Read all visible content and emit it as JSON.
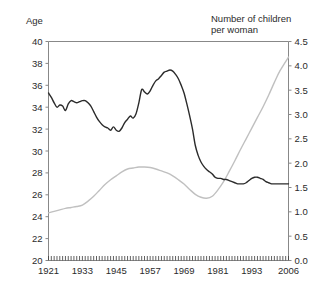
{
  "chart_data": {
    "type": "line",
    "title": "",
    "xlabel": "",
    "left_axis": {
      "label": "Age",
      "ticks": [
        "20",
        "22",
        "24",
        "26",
        "28",
        "30",
        "32",
        "34",
        "36",
        "38",
        "40"
      ],
      "min": 20,
      "max": 40
    },
    "right_axis": {
      "label": "Number of children\nper woman",
      "ticks": [
        "0.0",
        "0.5",
        "1.0",
        "1.5",
        "2.0",
        "2.5",
        "3.0",
        "3.5",
        "4.0",
        "4.5"
      ],
      "min": 0.0,
      "max": 4.5
    },
    "x_ticks": [
      "1921",
      "1933",
      "1945",
      "1957",
      "1969",
      "1981",
      "1993",
      "2006"
    ],
    "xlim": [
      1921,
      2006
    ],
    "grid": false,
    "legend_position": "none",
    "colors": {
      "age_line": "#2b2b2b",
      "children_line": "#c0c0c0",
      "axis": "#888888"
    },
    "series": [
      {
        "name": "Number of children per woman",
        "axis": "right",
        "color": "#c0c0c0",
        "x": [
          1921,
          1923,
          1925,
          1927,
          1929,
          1931,
          1933,
          1935,
          1937,
          1939,
          1941,
          1943,
          1945,
          1947,
          1949,
          1951,
          1953,
          1955,
          1957,
          1959,
          1961,
          1963,
          1965,
          1967,
          1969,
          1971,
          1973,
          1975,
          1977,
          1979,
          1981,
          1983,
          1985,
          1987,
          1989,
          1991,
          1993,
          1995,
          1997,
          1999,
          2001,
          2003,
          2006
        ],
        "values": [
          0.98,
          1.01,
          1.04,
          1.07,
          1.09,
          1.11,
          1.14,
          1.22,
          1.32,
          1.44,
          1.56,
          1.66,
          1.74,
          1.82,
          1.88,
          1.9,
          1.92,
          1.92,
          1.91,
          1.88,
          1.84,
          1.8,
          1.74,
          1.66,
          1.57,
          1.46,
          1.36,
          1.3,
          1.28,
          1.32,
          1.45,
          1.62,
          1.83,
          2.05,
          2.28,
          2.5,
          2.72,
          2.94,
          3.16,
          3.4,
          3.66,
          3.9,
          4.18
        ]
      },
      {
        "name": "Age",
        "axis": "left",
        "color": "#2b2b2b",
        "x": [
          1921,
          1922,
          1923,
          1924,
          1925,
          1926,
          1927,
          1928,
          1929,
          1930,
          1931,
          1932,
          1933,
          1934,
          1935,
          1936,
          1937,
          1938,
          1939,
          1940,
          1941,
          1942,
          1943,
          1944,
          1945,
          1946,
          1947,
          1948,
          1949,
          1950,
          1951,
          1952,
          1953,
          1954,
          1955,
          1956,
          1957,
          1958,
          1959,
          1960,
          1961,
          1962,
          1963,
          1964,
          1965,
          1966,
          1967,
          1968,
          1969,
          1970,
          1971,
          1972,
          1973,
          1974,
          1975,
          1976,
          1977,
          1978,
          1979,
          1980,
          1981,
          1982,
          1983,
          1984,
          1985,
          1986,
          1987,
          1988,
          1989,
          1990,
          1991,
          1992,
          1993,
          1994,
          1995,
          1996,
          1997,
          1998,
          1999,
          2000,
          2001,
          2002,
          2003,
          2004,
          2005,
          2006
        ],
        "values": [
          35.3,
          34.9,
          34.4,
          34.0,
          34.2,
          34.1,
          33.7,
          34.3,
          34.6,
          34.5,
          34.4,
          34.5,
          34.6,
          34.6,
          34.4,
          34.1,
          33.6,
          33.1,
          32.7,
          32.4,
          32.2,
          32.1,
          31.9,
          32.2,
          31.9,
          31.8,
          32.1,
          32.6,
          32.9,
          33.2,
          33.0,
          33.4,
          34.4,
          35.6,
          35.4,
          35.2,
          35.5,
          36.0,
          36.4,
          36.6,
          36.9,
          37.2,
          37.3,
          37.4,
          37.3,
          37.0,
          36.6,
          36.0,
          35.3,
          34.3,
          33.2,
          32.0,
          30.5,
          29.6,
          29.0,
          28.6,
          28.3,
          28.1,
          27.9,
          27.6,
          27.5,
          27.5,
          27.4,
          27.4,
          27.3,
          27.2,
          27.1,
          27.0,
          27.0,
          27.0,
          27.1,
          27.3,
          27.5,
          27.6,
          27.6,
          27.5,
          27.4,
          27.2,
          27.1,
          27.0,
          27.0,
          27.0,
          27.0,
          27.0,
          27.0,
          27.0
        ]
      }
    ]
  }
}
